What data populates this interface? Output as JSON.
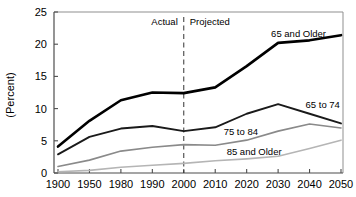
{
  "chart_data": {
    "type": "line",
    "title": "",
    "subtitle": "",
    "xlabel": "",
    "ylabel": "(Percent)",
    "categories": [
      "1900",
      "1950",
      "1980",
      "1990",
      "2000",
      "2010",
      "2020",
      "2030",
      "2040",
      "2050"
    ],
    "x": [
      1900,
      1950,
      1980,
      1990,
      2000,
      2010,
      2020,
      2030,
      2040,
      2050
    ],
    "ylim": [
      0,
      25
    ],
    "yticks": [
      0,
      5,
      10,
      15,
      20,
      25
    ],
    "ytick_labels": [
      "0",
      "5",
      "10",
      "15",
      "20",
      "25"
    ],
    "xtick_labels": [
      "1900",
      "1950",
      "1980",
      "1990",
      "2000",
      "2010",
      "2020",
      "2030",
      "2040",
      "2050"
    ],
    "grid": false,
    "legend_position": "inline-labels",
    "x_spacing": "categorical-even",
    "series": [
      {
        "name": "65 and Older",
        "color": "#000000",
        "width": 2.6,
        "values": [
          4.1,
          8.1,
          11.3,
          12.5,
          12.4,
          13.3,
          16.6,
          20.2,
          20.6,
          21.4
        ]
      },
      {
        "name": "65 to 74",
        "color": "#1a1a1a",
        "width": 1.9,
        "values": [
          2.9,
          5.6,
          6.9,
          7.3,
          6.5,
          7.1,
          9.2,
          10.7,
          9.2,
          7.7
        ]
      },
      {
        "name": "75 to 84",
        "color": "#8a8a8a",
        "width": 1.6,
        "values": [
          1.0,
          2.0,
          3.4,
          4.0,
          4.4,
          4.3,
          5.1,
          6.5,
          7.6,
          7.0
        ]
      },
      {
        "name": "85 and Older",
        "color": "#b5b5b5",
        "width": 1.6,
        "values": [
          0.2,
          0.4,
          0.9,
          1.2,
          1.5,
          1.9,
          2.2,
          2.6,
          3.8,
          5.1
        ]
      }
    ],
    "annotations": [
      {
        "name": "actual-label",
        "text": "Actual",
        "x_category": "2000",
        "align": "right-of-divider",
        "value_y": 23.2
      },
      {
        "name": "projected-label",
        "text": "Projected",
        "x_category": "2000",
        "align": "left-of-divider",
        "value_y": 23.2
      },
      {
        "name": "divider-line",
        "type": "vertical-dashed",
        "text": "",
        "x_category": "2000"
      }
    ],
    "series_labels": [
      {
        "name": "label-65-and-older",
        "text": "65 and Older"
      },
      {
        "name": "label-65-to-74",
        "text": "65 to 74"
      },
      {
        "name": "label-75-to-84",
        "text": "75 to 84"
      },
      {
        "name": "label-85-and-older",
        "text": "85 and Older"
      }
    ],
    "colors": {
      "axis": "#4d4d4d",
      "background": "#ffffff",
      "text": "#000000",
      "divider": "#333333"
    }
  },
  "axis": {
    "y_label": "(Percent)",
    "y_ticks": [
      "25",
      "20",
      "15",
      "10",
      "5",
      "0"
    ],
    "x_ticks": [
      "1900",
      "1950",
      "1980",
      "1990",
      "2000",
      "2010",
      "2020",
      "2030",
      "2040",
      "2050"
    ]
  },
  "annotations": {
    "actual": "Actual",
    "projected": "Projected"
  },
  "labels": {
    "s0": "65 and Older",
    "s1": "65 to 74",
    "s2": "75 to 84",
    "s3": "85 and Older"
  }
}
